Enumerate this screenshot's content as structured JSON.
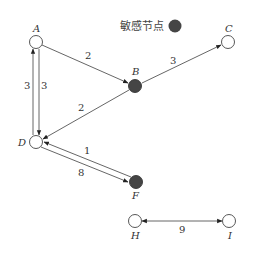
{
  "legend": {
    "label": "敏感节点",
    "color": "#454545"
  },
  "colors": {
    "sensitive": "#454545",
    "normal_fill": "#ffffff",
    "stroke": "#444444"
  },
  "nodes": [
    {
      "id": "A",
      "label": "A",
      "sensitive": false
    },
    {
      "id": "B",
      "label": "B",
      "sensitive": true
    },
    {
      "id": "C",
      "label": "C",
      "sensitive": false
    },
    {
      "id": "D",
      "label": "D",
      "sensitive": false
    },
    {
      "id": "F",
      "label": "F",
      "sensitive": true
    },
    {
      "id": "H",
      "label": "H",
      "sensitive": false
    },
    {
      "id": "I",
      "label": "I",
      "sensitive": false
    }
  ],
  "edges": [
    {
      "from": "A",
      "to": "B",
      "weight": "2"
    },
    {
      "from": "B",
      "to": "C",
      "weight": "3"
    },
    {
      "from": "B",
      "to": "D",
      "weight": "2"
    },
    {
      "from": "D",
      "to": "A",
      "weight": "3"
    },
    {
      "from": "A",
      "to": "D",
      "weight": "3"
    },
    {
      "from": "F",
      "to": "D",
      "weight": "1"
    },
    {
      "from": "D",
      "to": "F",
      "weight": "8"
    },
    {
      "from": "H",
      "to": "I",
      "weight": "9",
      "bidirectional": true
    }
  ]
}
